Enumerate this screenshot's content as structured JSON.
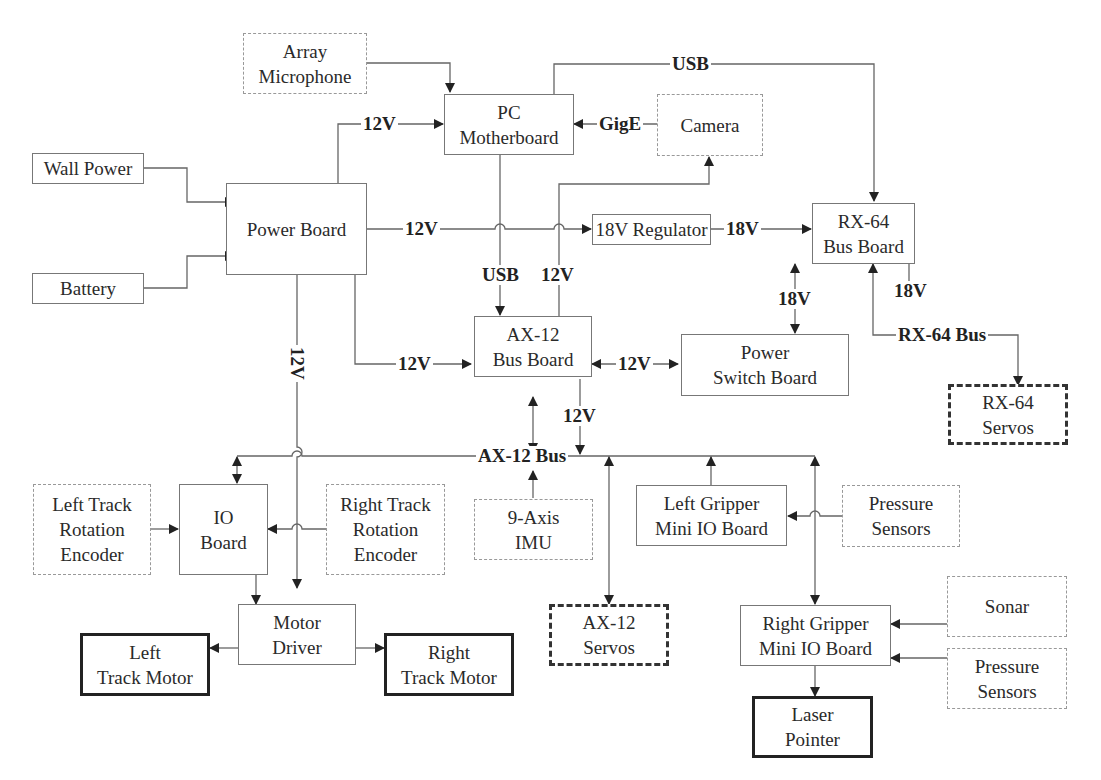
{
  "diagram": {
    "type": "block-diagram",
    "nodes": {
      "array_mic": {
        "label": "Array\nMicrophone",
        "style": "dotted"
      },
      "pc": {
        "label": "PC\nMotherboard",
        "style": "solid"
      },
      "camera": {
        "label": "Camera",
        "style": "dotted"
      },
      "wall_power": {
        "label": "Wall Power",
        "style": "solid"
      },
      "battery": {
        "label": "Battery",
        "style": "solid"
      },
      "power_board": {
        "label": "Power Board",
        "style": "solid"
      },
      "regulator": {
        "label": "18V Regulator",
        "style": "solid"
      },
      "rx64_board": {
        "label": "RX-64\nBus Board",
        "style": "solid"
      },
      "ax12_board": {
        "label": "AX-12\nBus Board",
        "style": "solid"
      },
      "power_switch": {
        "label": "Power\nSwitch Board",
        "style": "solid"
      },
      "rx64_servos": {
        "label": "RX-64\nServos",
        "style": "bold-dashed"
      },
      "left_encoder": {
        "label": "Left Track\nRotation\nEncoder",
        "style": "dotted"
      },
      "io_board": {
        "label": "IO\nBoard",
        "style": "solid"
      },
      "right_encoder": {
        "label": "Right Track\nRotation\nEncoder",
        "style": "dotted"
      },
      "imu": {
        "label": "9-Axis\nIMU",
        "style": "dotted"
      },
      "left_gripper": {
        "label": "Left Gripper\nMini IO Board",
        "style": "solid"
      },
      "pressure1": {
        "label": "Pressure\nSensors",
        "style": "dotted"
      },
      "motor_driver": {
        "label": "Motor\nDriver",
        "style": "solid"
      },
      "left_motor": {
        "label": "Left\nTrack Motor",
        "style": "thick"
      },
      "right_motor": {
        "label": "Right\nTrack Motor",
        "style": "thick"
      },
      "ax12_servos": {
        "label": "AX-12\nServos",
        "style": "bold-dashed"
      },
      "right_gripper": {
        "label": "Right Gripper\nMini IO Board",
        "style": "solid"
      },
      "sonar": {
        "label": "Sonar",
        "style": "dotted"
      },
      "pressure2": {
        "label": "Pressure\nSensors",
        "style": "dotted"
      },
      "laser": {
        "label": "Laser\nPointer",
        "style": "thick"
      }
    },
    "edge_labels": {
      "usb_top": "USB",
      "v12_pc": "12V",
      "gige": "GigE",
      "v12_reg": "12V",
      "v18_reg": "18V",
      "usb_ax": "USB",
      "v12_cam": "12V",
      "v12_vert": "12V",
      "v12_ax": "12V",
      "v12_switch": "12V",
      "v18_switch": "18V",
      "v18_rxbus": "18V",
      "rx64_bus": "RX-64 Bus",
      "v12_axbus": "12V",
      "ax12_bus": "AX-12 Bus"
    }
  }
}
